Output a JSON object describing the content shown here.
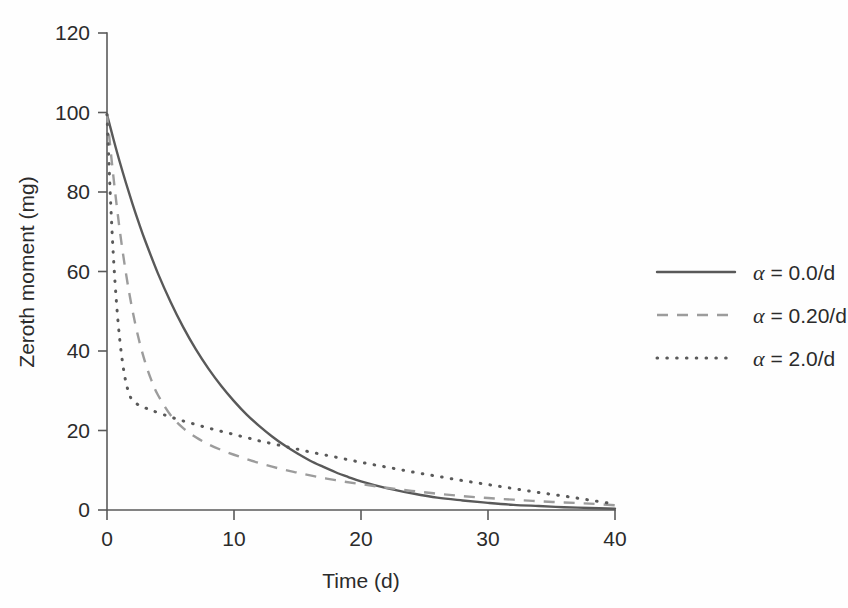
{
  "chart_data": {
    "type": "line",
    "title": "",
    "xlabel": "Time (d)",
    "ylabel": "Zeroth moment (mg)",
    "xlim": [
      0,
      40
    ],
    "ylim": [
      0,
      120
    ],
    "xticks": [
      "0",
      "10",
      "20",
      "30",
      "40"
    ],
    "xtick_values": [
      0,
      10,
      20,
      30,
      40
    ],
    "yticks": [
      "0",
      "20",
      "40",
      "60",
      "80",
      "100",
      "120"
    ],
    "ytick_values": [
      0,
      20,
      40,
      60,
      80,
      100,
      120
    ],
    "grid": false,
    "legend_position": "right",
    "colors": {
      "solid": "#595959",
      "dashed": "#9c9c9c",
      "dotted": "#595959",
      "axis": "#5a5a5a",
      "text": "#2b2b2b",
      "background": "#fefefe"
    },
    "series": [
      {
        "name": "alpha-0.0",
        "label_alpha": "α",
        "label_rest": " = 0.0/d",
        "legend_text": "α = 0.0/d",
        "style": "solid",
        "color": "#595959",
        "x": [
          0,
          0.5,
          1,
          1.5,
          2,
          2.5,
          3,
          4,
          5,
          6,
          7,
          8,
          9,
          10,
          11,
          12,
          13,
          14,
          15,
          16,
          17,
          18,
          19,
          20,
          22,
          24,
          26,
          28,
          30,
          32,
          34,
          36,
          38,
          40
        ],
        "y": [
          99.5,
          93.4,
          87.6,
          82.2,
          77.1,
          72.3,
          67.8,
          59.6,
          52.4,
          46.0,
          40.4,
          35.5,
          31.2,
          27.4,
          24.0,
          21.1,
          18.5,
          16.2,
          14.2,
          12.4,
          10.9,
          9.5,
          8.3,
          7.2,
          5.5,
          4.2,
          3.1,
          2.4,
          1.8,
          1.3,
          1.0,
          0.7,
          0.5,
          0.3
        ]
      },
      {
        "name": "alpha-0.20",
        "label_alpha": "α",
        "label_rest": " = 0.20/d",
        "legend_text": "α = 0.20/d",
        "style": "dashed",
        "color": "#9c9c9c",
        "x": [
          0,
          0.5,
          1,
          1.5,
          2,
          2.5,
          3,
          3.5,
          4,
          5,
          6,
          7,
          8,
          9,
          10,
          11,
          12,
          13,
          14,
          15,
          16,
          18,
          20,
          22,
          24,
          26,
          28,
          30,
          32,
          34,
          36,
          38,
          40
        ],
        "y": [
          99.5,
          84.0,
          70.5,
          59.4,
          50.3,
          43.0,
          37.2,
          32.6,
          29.0,
          23.9,
          20.6,
          18.3,
          16.5,
          15.1,
          13.9,
          12.8,
          11.8,
          10.9,
          10.1,
          9.4,
          8.7,
          7.5,
          6.5,
          5.6,
          4.8,
          4.1,
          3.5,
          3.0,
          2.6,
          2.2,
          1.9,
          1.6,
          1.2
        ]
      },
      {
        "name": "alpha-2.0",
        "label_alpha": "α",
        "label_rest": " = 2.0/d",
        "legend_text": "α = 2.0/d",
        "style": "dotted",
        "color": "#595959",
        "x": [
          0,
          0.25,
          0.5,
          0.75,
          1,
          1.25,
          1.5,
          1.75,
          2,
          2.5,
          3,
          3.5,
          4,
          5,
          6,
          7,
          8,
          9,
          10,
          11,
          12,
          14,
          16,
          18,
          20,
          22,
          24,
          26,
          28,
          30,
          32,
          34,
          36,
          38,
          40
        ],
        "y": [
          99.5,
          80.0,
          64.0,
          52.0,
          43.0,
          36.5,
          32.0,
          29.2,
          27.6,
          26.4,
          25.7,
          25.1,
          24.5,
          23.4,
          22.4,
          21.5,
          20.6,
          19.8,
          19.0,
          18.2,
          17.4,
          16.0,
          14.6,
          13.3,
          12.0,
          10.8,
          9.6,
          8.5,
          7.4,
          6.4,
          5.4,
          4.4,
          3.5,
          2.5,
          1.5
        ]
      }
    ]
  },
  "legend": {
    "items": [
      {
        "sample": "solid-line-sample",
        "text": "α = 0.0/d"
      },
      {
        "sample": "dashed-line-sample",
        "text": "α = 0.20/d"
      },
      {
        "sample": "dotted-line-sample",
        "text": "α = 2.0/d"
      }
    ]
  }
}
